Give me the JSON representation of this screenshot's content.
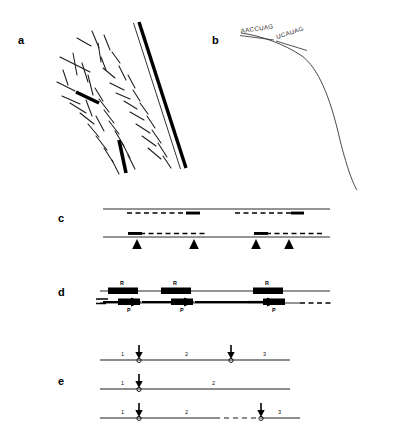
{
  "figure": {
    "background_color": "#ffffff",
    "ink_color": "#000000",
    "width": 398,
    "height": 441
  },
  "panels": [
    {
      "id": "a",
      "label": "a",
      "label_x": 18,
      "label_y": 44,
      "caption_type": "electron-micrograph-tracing",
      "description": "Tracing of a long thick duplex filament crossed by many short thin fibrils and three short thick segments"
    },
    {
      "id": "b",
      "label": "b",
      "label_x": 212,
      "label_y": 44,
      "caption_type": "annotated-curve",
      "sequence_labels": [
        {
          "text": "AACCUAG",
          "x": 243,
          "y": 31,
          "rotation": -13
        },
        {
          "text": "UCAUAG",
          "x": 280,
          "y": 39,
          "rotation": -26
        }
      ],
      "description": "Curved filament with two RNA sequence annotations along its upper arm"
    },
    {
      "id": "c",
      "label": "c",
      "label_x": 58,
      "label_y": 222,
      "caption_type": "hybridization-map",
      "lines": [
        {
          "y": 209,
          "x_start": 103,
          "x_end": 330,
          "dashed_regions": [
            {
              "x_start": 127,
              "x_end": 200,
              "thick_cap_at": "end"
            },
            {
              "x_start": 235,
              "x_end": 300,
              "thick_cap_at": "end"
            }
          ],
          "arrowheads": []
        },
        {
          "y": 237,
          "x_start": 103,
          "x_end": 330,
          "dashed_regions": [
            {
              "x_start": 128,
              "x_end": 205,
              "thick_cap_at": "start"
            },
            {
              "x_start": 254,
              "x_end": 320,
              "thick_cap_at": "start"
            }
          ],
          "arrowheads": [
            137,
            194,
            253,
            289
          ]
        }
      ]
    },
    {
      "id": "d",
      "label": "d",
      "label_x": 58,
      "label_y": 296,
      "caption_type": "replication-map",
      "top_line": {
        "y": 291,
        "x_start": 100,
        "x_end": 330
      },
      "bottom_line": {
        "y": 303,
        "x_start": 100,
        "x_end": 300
      },
      "bottom_dashed": {
        "x_start": 300,
        "x_end": 333
      },
      "units": [
        {
          "r_box_x": 108,
          "r_box_w": 30,
          "p_box_x": 118,
          "p_box_w": 22,
          "r_label": "R",
          "p_label": "P",
          "arrow_x": 103,
          "arrow_len": 34
        },
        {
          "r_box_x": 161,
          "r_box_w": 30,
          "p_box_x": 171,
          "p_box_w": 22,
          "r_label": "R",
          "p_label": "P",
          "arrow_x": 140,
          "arrow_len": 52
        },
        {
          "r_box_x": 253,
          "r_box_w": 30,
          "p_box_x": 263,
          "p_box_w": 22,
          "r_label": "R",
          "p_label": "P",
          "arrow_x": 192,
          "arrow_len": 92
        }
      ]
    },
    {
      "id": "e",
      "label": "e",
      "label_x": 58,
      "label_y": 385,
      "caption_type": "segment-cleavage-map",
      "rows": [
        {
          "y": 360,
          "x_start": 100,
          "x_end": 290,
          "dashed_regions": [],
          "segments": [
            {
              "label": "1",
              "x": 121
            },
            {
              "label": "2",
              "x": 185
            },
            {
              "label": "3",
              "x": 263
            }
          ],
          "sites": [
            139,
            231
          ]
        },
        {
          "y": 389,
          "x_start": 100,
          "x_end": 290,
          "dashed_regions": [],
          "segments": [
            {
              "label": "1",
              "x": 121
            },
            {
              "label": "2",
              "x": 212
            }
          ],
          "sites": [
            139
          ]
        },
        {
          "y": 418,
          "x_start": 100,
          "x_end": 300,
          "dashed_regions": [
            {
              "x_start": 215,
              "x_end": 260
            }
          ],
          "segments": [
            {
              "label": "1",
              "x": 121
            },
            {
              "label": "2",
              "x": 185
            },
            {
              "label": "3",
              "x": 278
            }
          ],
          "sites": [
            139,
            261
          ]
        }
      ]
    }
  ],
  "panel_a_geometry": {
    "duplex_outer": {
      "x1": 139,
      "y1": 22,
      "x2": 186,
      "y2": 168
    },
    "duplex_inner": {
      "x1": 134,
      "y1": 22,
      "x2": 181,
      "y2": 168
    },
    "thick_fibrils": [
      {
        "x1": 76,
        "y1": 92,
        "x2": 99,
        "y2": 103
      },
      {
        "x1": 119,
        "y1": 140,
        "x2": 126,
        "y2": 173
      },
      {
        "x1": 108,
        "y1": 122,
        "x2": 112,
        "y2": 128
      }
    ],
    "thin_fibrils": [
      [
        77,
        38,
        91,
        46
      ],
      [
        92,
        31,
        99,
        48
      ],
      [
        60,
        57,
        90,
        72
      ],
      [
        73,
        53,
        77,
        75
      ],
      [
        98,
        43,
        101,
        62
      ],
      [
        104,
        35,
        110,
        50
      ],
      [
        63,
        70,
        68,
        85
      ],
      [
        82,
        63,
        88,
        82
      ],
      [
        101,
        57,
        106,
        70
      ],
      [
        112,
        52,
        120,
        63
      ],
      [
        57,
        82,
        75,
        91
      ],
      [
        88,
        75,
        93,
        95
      ],
      [
        103,
        68,
        115,
        78
      ],
      [
        119,
        66,
        126,
        80
      ],
      [
        62,
        96,
        80,
        104
      ],
      [
        95,
        88,
        103,
        101
      ],
      [
        110,
        83,
        124,
        90
      ],
      [
        128,
        75,
        135,
        88
      ],
      [
        70,
        103,
        86,
        113
      ],
      [
        99,
        99,
        109,
        112
      ],
      [
        116,
        93,
        130,
        99
      ],
      [
        133,
        90,
        140,
        101
      ],
      [
        80,
        113,
        94,
        124
      ],
      [
        104,
        110,
        114,
        123
      ],
      [
        124,
        101,
        137,
        109
      ],
      [
        140,
        103,
        148,
        114
      ],
      [
        88,
        124,
        99,
        137
      ],
      [
        109,
        121,
        119,
        134
      ],
      [
        130,
        112,
        144,
        120
      ],
      [
        147,
        116,
        155,
        128
      ],
      [
        96,
        136,
        107,
        150
      ],
      [
        115,
        131,
        124,
        146
      ],
      [
        136,
        124,
        150,
        133
      ],
      [
        152,
        130,
        161,
        143
      ],
      [
        104,
        148,
        113,
        162
      ],
      [
        122,
        143,
        130,
        158
      ],
      [
        142,
        136,
        156,
        146
      ],
      [
        158,
        143,
        167,
        157
      ],
      [
        112,
        160,
        119,
        174
      ],
      [
        128,
        155,
        135,
        169
      ],
      [
        148,
        148,
        161,
        159
      ],
      [
        163,
        156,
        171,
        168
      ],
      [
        96,
        116,
        104,
        131
      ],
      [
        86,
        100,
        92,
        116
      ]
    ]
  },
  "panel_b_geometry": {
    "curve_path": "M 241,33 C 262,36 284,44 302,56 C 318,68 330,96 340,140 C 346,164 352,182 357,190",
    "annotation_underline_1": {
      "x1": 240,
      "y1": 35,
      "x2": 273,
      "y2": 39
    },
    "annotation_underline_2": {
      "x1": 276,
      "y1": 40,
      "x2": 306,
      "y2": 49
    }
  }
}
